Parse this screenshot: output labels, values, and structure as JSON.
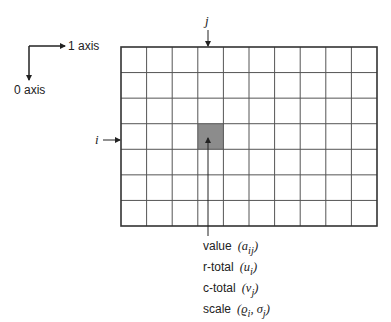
{
  "axes": {
    "axis1_label": "1 axis",
    "axis0_label": "0 axis"
  },
  "grid": {
    "rows": 7,
    "cols": 10,
    "highlight_row": 3,
    "highlight_col": 3,
    "line_color": "#555555",
    "highlight_color": "#8c8c8c"
  },
  "indices": {
    "row_index_label": "i",
    "col_index_label": "j"
  },
  "legend": [
    {
      "label": "value",
      "symbol": "(a",
      "sub": "ij",
      "tail": ")"
    },
    {
      "label": "r-total",
      "symbol": "(u",
      "sub": "i",
      "tail": ")"
    },
    {
      "label": "c-total",
      "symbol": "(v",
      "sub": "j",
      "tail": ")"
    },
    {
      "label": "scale",
      "symbol": "(ϱ",
      "sub": "i",
      "mid": ", σ",
      "sub2": "j",
      "tail": ")"
    }
  ]
}
